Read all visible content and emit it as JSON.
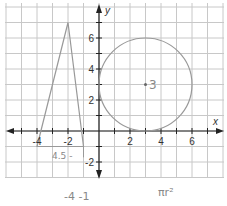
{
  "figure": {
    "type": "coordinate-plane",
    "axes": {
      "x_label": "x",
      "y_label": "y",
      "x_ticks": [
        "-4",
        "-2",
        "2",
        "4",
        "6"
      ],
      "y_ticks": [
        "6",
        "4",
        "2",
        "-2"
      ],
      "x_range": [
        -6,
        8
      ],
      "y_range": [
        -3,
        8
      ]
    },
    "shapes": {
      "triangle": {
        "vertices": [
          [
            -4,
            -1
          ],
          [
            -2,
            7
          ],
          [
            -1,
            -1
          ]
        ],
        "base_line_y": -1
      },
      "circle": {
        "center": [
          3,
          3
        ],
        "radius": 3
      }
    },
    "annotations": {
      "center_label": "3",
      "base_label": "4.5 -",
      "bottom_left": "-4 -1",
      "bottom_right": "πr²"
    }
  },
  "colors": {
    "grid": "#c8c8c8",
    "axis": "#222222",
    "shape": "#999999",
    "handwriting": "#888888"
  }
}
